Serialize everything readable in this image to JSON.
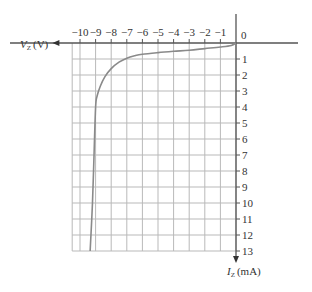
{
  "chart_data": {
    "type": "line",
    "title": "",
    "xlabel": "V_Z (V)",
    "ylabel": "I_Z (mA)",
    "xlabel_main": "V",
    "xlabel_sub": "Z",
    "xlabel_unit": "(V)",
    "ylabel_main": "I",
    "ylabel_sub": "Z",
    "ylabel_unit": "(mA)",
    "x_ticks": [
      "−10",
      "−9",
      "−8",
      "−7",
      "−6",
      "−5",
      "−4",
      "−3",
      "−2",
      "−1"
    ],
    "x_tick_values": [
      -10,
      -9,
      -8,
      -7,
      -6,
      -5,
      -4,
      -3,
      -2,
      -1
    ],
    "origin_label": "0",
    "y_ticks": [
      "1",
      "2",
      "3",
      "4",
      "5",
      "6",
      "7",
      "8",
      "9",
      "10",
      "11",
      "12",
      "13"
    ],
    "y_tick_values": [
      1,
      2,
      3,
      4,
      5,
      6,
      7,
      8,
      9,
      10,
      11,
      12,
      13
    ],
    "xlim": [
      -11,
      0
    ],
    "ylim": [
      0,
      13
    ],
    "grid": true,
    "legend": null,
    "series": [
      {
        "name": "Zener reverse characteristic",
        "x": [
          0,
          -0.3,
          -1,
          -2,
          -3,
          -4,
          -5,
          -6,
          -6.5,
          -7,
          -7.5,
          -8,
          -8.4,
          -8.7,
          -8.9,
          -9.0,
          -9.1,
          -9.2,
          -9.35
        ],
        "y": [
          0,
          0.15,
          0.25,
          0.35,
          0.45,
          0.52,
          0.6,
          0.7,
          0.8,
          0.95,
          1.2,
          1.6,
          2.1,
          2.7,
          3.3,
          4.0,
          7.0,
          10.0,
          13.0
        ]
      }
    ]
  }
}
